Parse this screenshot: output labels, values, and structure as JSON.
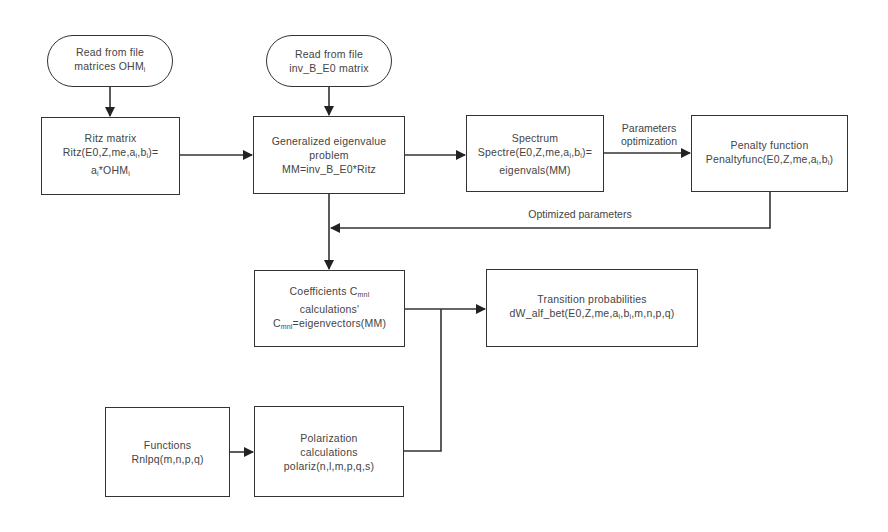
{
  "nodes": {
    "read_ohm": {
      "line1": "Read from file",
      "line2_prefix": "matrices OHM",
      "line2_sub": "i"
    },
    "read_inv": {
      "line1": "Read from file",
      "line2": "inv_B_E0 matrix"
    },
    "ritz": {
      "line1": "Ritz matrix",
      "line2": "Ritz(E0,Z,me,a",
      "line2_sub1": "i",
      "line2_mid": ",b",
      "line2_sub2": "i",
      "line2_end": ")=",
      "line3": "a",
      "line3_sub1": "i",
      "line3_mid": "*OHM",
      "line3_sub2": "i"
    },
    "geneig": {
      "line1": "Generalized eigenvalue",
      "line2": "problem",
      "line3": "MM=inv_B_E0*Ritz"
    },
    "spectrum": {
      "line1": "Spectrum",
      "line2": "Spectre(E0,Z,me,a",
      "line2_sub1": "i",
      "line2_mid": ",b",
      "line2_sub2": "i",
      "line2_end": ")=",
      "line3": "eigenvals(MM)"
    },
    "penalty": {
      "line1": "Penalty function",
      "line2": "Penaltyfunc(E0,Z,me,a",
      "line2_sub1": "i",
      "line2_mid": ",b",
      "line2_sub2": "i",
      "line2_end": ")"
    },
    "coeff": {
      "line1": "Coefficients C",
      "line1_sub": "mnl",
      "line2": "calculations'",
      "line3": "C",
      "line3_sub": "mnl",
      "line3_end": "=eigenvectors(MM)"
    },
    "transition": {
      "line1": "Transition probabilities",
      "line2": "dW_alf_bet(E0,Z,me,a",
      "line2_sub1": "i",
      "line2_mid": ",b",
      "line2_sub2": "i",
      "line2_end": ",m,n,p,q)"
    },
    "functions": {
      "line1": "Functions",
      "line2": "Rnlpq(m,n,p,q)"
    },
    "polariz": {
      "line1": "Polarization",
      "line2": "calculations",
      "line3": "polariz(n,l,m,p,q,s)"
    }
  },
  "edge_labels": {
    "param_opt_1": "Parameters",
    "param_opt_2": "optimization",
    "optimized": "Optimized parameters"
  }
}
